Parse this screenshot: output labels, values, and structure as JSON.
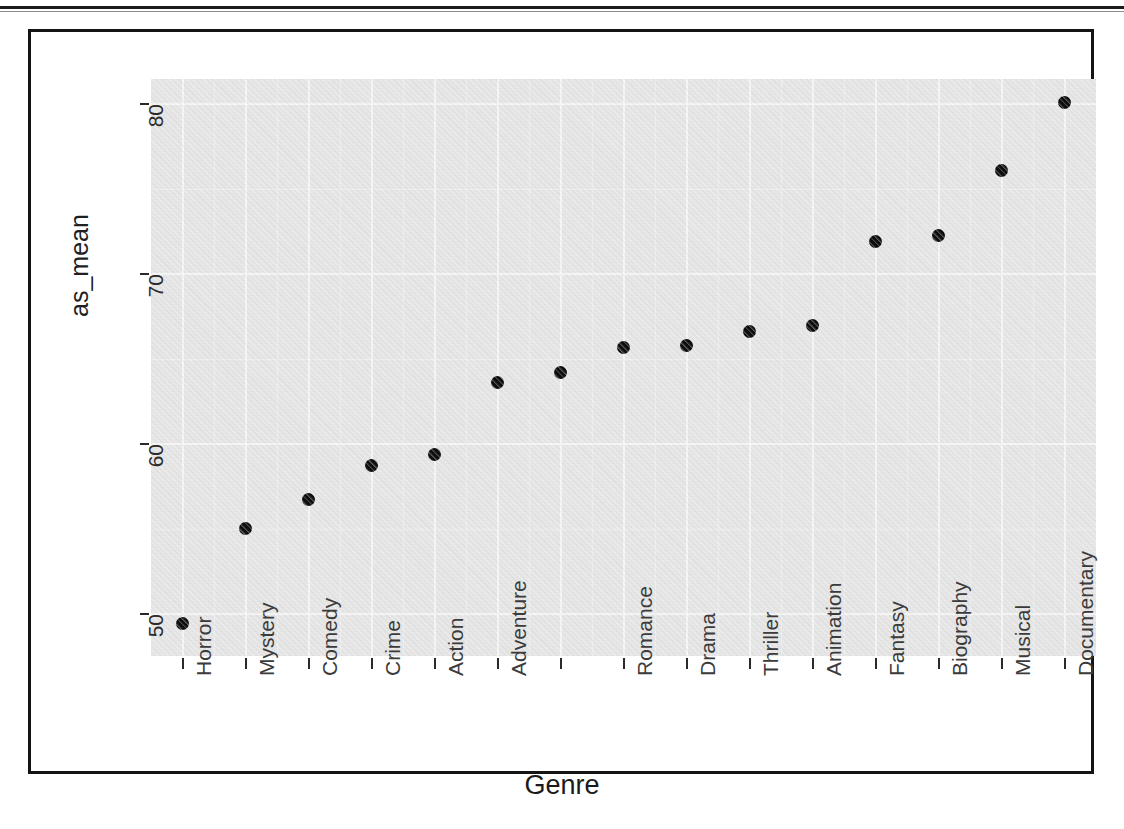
{
  "chart_data": {
    "type": "scatter",
    "title": "",
    "xlabel": "Genre",
    "ylabel": "as_mean",
    "ylim": [
      47.5,
      81.5
    ],
    "yticks": [
      50,
      60,
      70,
      80
    ],
    "ytick_labels": [
      "50",
      "60",
      "70",
      "80"
    ],
    "grid": true,
    "legend": "none",
    "categories": [
      "Horror",
      "Mystery",
      "Comedy",
      "Crime",
      "Action",
      "Adventure",
      "",
      "Romance",
      "Drama",
      "Thriller",
      "Animation",
      "Fantasy",
      "Biography",
      "Musical",
      "Documentary"
    ],
    "values": [
      49.4,
      55.0,
      56.7,
      58.7,
      59.4,
      63.6,
      64.2,
      65.7,
      65.8,
      66.6,
      67.0,
      71.9,
      72.3,
      76.1,
      80.1
    ],
    "point_color": "#0d0d0d",
    "panel_color": "#ebebeb",
    "gridline_color": "#fbfbfb"
  },
  "figure": {
    "axis_text_color": "#3b3b3b",
    "frame_color": "#141414"
  }
}
